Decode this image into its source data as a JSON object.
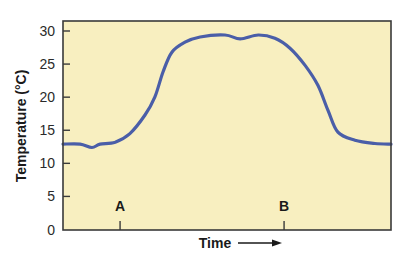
{
  "chart_data": {
    "type": "line",
    "title": "",
    "xlabel": "Time",
    "ylabel": "Temperature (°C)",
    "ylim": [
      0,
      30
    ],
    "xlim": [
      0,
      100
    ],
    "grid": false,
    "legend": null,
    "yticks": [
      0,
      5,
      10,
      15,
      20,
      25,
      30
    ],
    "x_markers": [
      {
        "label": "A",
        "x": 17.4
      },
      {
        "label": "B",
        "x": 67.4
      }
    ],
    "xlabel_arrow": true,
    "series": [
      {
        "name": "Temperature",
        "color": "#4a5ea8",
        "x": [
          0,
          5.2,
          8.8,
          11.3,
          15.9,
          20.4,
          25,
          28,
          30.5,
          33.2,
          37.2,
          41.8,
          49.4,
          54,
          59.5,
          64.6,
          69.2,
          73.8,
          77.7,
          80.8,
          83.8,
          89,
          95.1,
          100
        ],
        "y": [
          12.9,
          12.9,
          12.4,
          12.9,
          13.2,
          14.5,
          17.3,
          20.0,
          23.8,
          26.8,
          28.3,
          29.1,
          29.4,
          28.8,
          29.4,
          28.9,
          27.4,
          24.8,
          21.8,
          18.0,
          14.7,
          13.5,
          13.0,
          12.9
        ]
      }
    ],
    "colors": {
      "plot_background": "#f8efc0",
      "axis": "#3a3a3a",
      "line": "#4a5ea8"
    }
  }
}
